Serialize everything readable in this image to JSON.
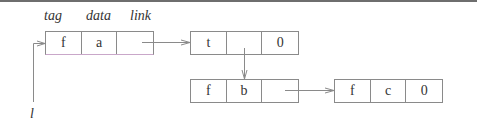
{
  "diagram": {
    "field_labels": {
      "tag": "tag",
      "data": "data",
      "link": "link"
    },
    "pointer_label": "l",
    "nodes": [
      {
        "id": "n1",
        "cells": [
          "f",
          "a",
          ""
        ]
      },
      {
        "id": "n2",
        "cells": [
          "t",
          "",
          "0"
        ]
      },
      {
        "id": "n3",
        "cells": [
          "f",
          "b",
          ""
        ]
      },
      {
        "id": "n4",
        "cells": [
          "f",
          "c",
          "0"
        ]
      }
    ],
    "edges": [
      {
        "from": "l",
        "to": "n1"
      },
      {
        "from": "n1.link",
        "to": "n2"
      },
      {
        "from": "n2.data",
        "to": "n3"
      },
      {
        "from": "n3.link",
        "to": "n4"
      }
    ],
    "colors": {
      "line": "#8a8a8a",
      "text": "#333333",
      "accent_underline": "#c9a7c9"
    }
  }
}
